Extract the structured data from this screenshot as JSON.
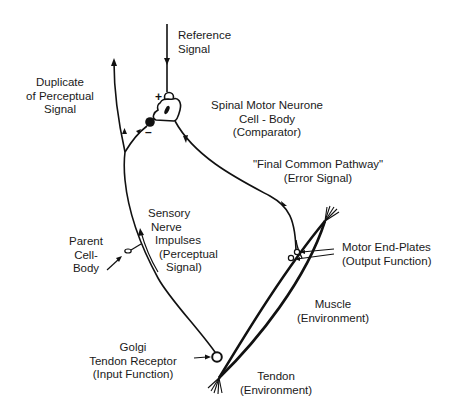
{
  "labels": {
    "reference_signal": [
      "Reference",
      "Signal"
    ],
    "duplicate_perceptual": [
      "Duplicate",
      "of Perceptual",
      "Signal"
    ],
    "comparator": [
      "Spinal Motor Neurone",
      "Cell - Body",
      "(Comparator)"
    ],
    "final_common_pathway": [
      "\"Final Common Pathway\"",
      "(Error Signal)"
    ],
    "sensory_nerve": [
      "Sensory",
      "Nerve",
      "Impulses",
      "(Perceptual",
      "Signal)"
    ],
    "parent_cell_body": [
      "Parent",
      "Cell-",
      "Body"
    ],
    "motor_end_plates": [
      "Motor End-Plates",
      "(Output Function)"
    ],
    "muscle": [
      "Muscle",
      "(Environment)"
    ],
    "golgi_receptor": [
      "Golgi",
      "Tendon Receptor",
      "(Input Function)"
    ],
    "tendon": [
      "Tendon",
      "(Environment)"
    ]
  },
  "symbols": {
    "plus": "+",
    "minus": "–"
  },
  "colors": {
    "line": "#111111",
    "text": "#1a1a1a",
    "background": "#ffffff"
  }
}
